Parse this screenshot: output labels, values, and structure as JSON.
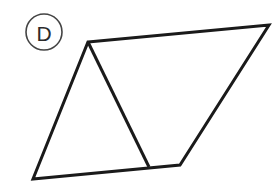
{
  "figure": {
    "label": "D",
    "background_color": "#ffffff",
    "stroke_color": "#1a1a1a",
    "badge_stroke_color": "#444444",
    "badge_text_color": "#2b2b2b",
    "stroke_width": 3,
    "canvas": {
      "width": 280,
      "height": 181
    },
    "badge": {
      "cx": 44,
      "cy": 32,
      "r": 18
    },
    "outer_polygon_points": "88,42 269,25 180,165 33,179",
    "inner_line": {
      "x1": 88,
      "y1": 42,
      "x2": 149,
      "y2": 167
    },
    "vertices": [
      {
        "name": "top-left-apex",
        "x": 88,
        "y": 42
      },
      {
        "name": "top-right",
        "x": 269,
        "y": 25
      },
      {
        "name": "bottom-right",
        "x": 180,
        "y": 165
      },
      {
        "name": "bottom-left",
        "x": 33,
        "y": 179
      },
      {
        "name": "inner-bottom",
        "x": 149,
        "y": 167
      }
    ]
  }
}
